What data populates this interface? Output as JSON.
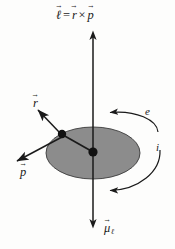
{
  "figure": {
    "background_color": "#fdfdfc",
    "ink_color": "#1a1a1a",
    "disk_fill_color": "#8c8c8c"
  },
  "labels": {
    "angular_momentum": {
      "symbol_l": "ℓ",
      "equals": "=",
      "symbol_r": "r",
      "cross": "×",
      "symbol_p": "p",
      "full_text": "ℓ = r × p"
    },
    "radius_vector": "r",
    "momentum_vector": "p",
    "magnetic_moment": {
      "symbol": "μ",
      "subscript": "ℓ"
    },
    "electron": "e",
    "current": "i"
  },
  "geometry": {
    "axis_x": 93,
    "axis_top_y": 32,
    "axis_bottom_y": 227,
    "disk_center": [
      93,
      153
    ],
    "disk_radius_x": 47,
    "disk_radius_y": 26,
    "electron_dot": [
      62,
      134
    ],
    "center_dot": [
      93,
      152
    ],
    "electron_dot_radius": 4.2,
    "center_dot_radius": 4.6,
    "r_arrow_tip": [
      36,
      108
    ],
    "p_arrow_tip": [
      14,
      163
    ]
  },
  "elements": {
    "vertical_axis_name": "angular-momentum-axis",
    "disk_name": "orbit-disk",
    "upper_curve_name": "electron-direction-arc",
    "lower_curve_name": "current-direction-arc"
  }
}
